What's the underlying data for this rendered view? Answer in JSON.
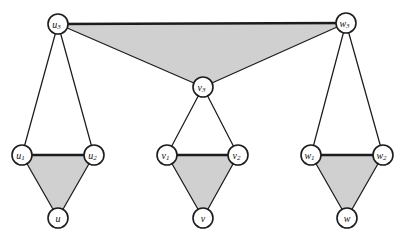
{
  "figure": {
    "background_color": "#ffffff",
    "face_fill_color": "#d0d0d0",
    "edge_color": "#1c1c1c",
    "node_fill_color": "#ffffff",
    "node_stroke_color": "#1c1c1c",
    "node_radius": 10,
    "width": 406,
    "height": 245
  },
  "nodes": [
    {
      "id": "u3",
      "base": "u",
      "sub": "3",
      "x": 58,
      "y": 24,
      "label": "u3"
    },
    {
      "id": "w3",
      "base": "w",
      "sub": "3",
      "x": 346,
      "y": 23,
      "label": "w3"
    },
    {
      "id": "v3",
      "base": "v",
      "sub": "3",
      "x": 203,
      "y": 87,
      "label": "v3"
    },
    {
      "id": "u1",
      "base": "u",
      "sub": "1",
      "x": 22,
      "y": 155,
      "label": "u1"
    },
    {
      "id": "u2",
      "base": "u",
      "sub": "2",
      "x": 94,
      "y": 155,
      "label": "u2"
    },
    {
      "id": "v1",
      "base": "v",
      "sub": "1",
      "x": 167,
      "y": 155,
      "label": "v1"
    },
    {
      "id": "v2",
      "base": "v",
      "sub": "2",
      "x": 238,
      "y": 155,
      "label": "v2"
    },
    {
      "id": "w1",
      "base": "w",
      "sub": "1",
      "x": 311,
      "y": 155,
      "label": "w1"
    },
    {
      "id": "w2",
      "base": "w",
      "sub": "2",
      "x": 383,
      "y": 155,
      "label": "w2"
    },
    {
      "id": "u",
      "base": "u",
      "sub": "",
      "x": 58,
      "y": 218,
      "label": "u"
    },
    {
      "id": "v",
      "base": "v",
      "sub": "",
      "x": 203,
      "y": 218,
      "label": "v"
    },
    {
      "id": "w",
      "base": "w",
      "sub": "",
      "x": 347,
      "y": 218,
      "label": "w"
    }
  ],
  "edges": [
    {
      "id": "e-u3-w3",
      "from": "u3",
      "to": "w3",
      "weight": "thick"
    },
    {
      "id": "e-u3-v3",
      "from": "u3",
      "to": "v3",
      "weight": "thin"
    },
    {
      "id": "e-w3-v3",
      "from": "w3",
      "to": "v3",
      "weight": "thin"
    },
    {
      "id": "e-u3-u1",
      "from": "u3",
      "to": "u1",
      "weight": "thin"
    },
    {
      "id": "e-u3-u2",
      "from": "u3",
      "to": "u2",
      "weight": "thin"
    },
    {
      "id": "e-u1-u2",
      "from": "u1",
      "to": "u2",
      "weight": "thick"
    },
    {
      "id": "e-u1-u",
      "from": "u1",
      "to": "u",
      "weight": "thin"
    },
    {
      "id": "e-u2-u",
      "from": "u2",
      "to": "u",
      "weight": "thin"
    },
    {
      "id": "e-v3-v1",
      "from": "v3",
      "to": "v1",
      "weight": "thin"
    },
    {
      "id": "e-v3-v2",
      "from": "v3",
      "to": "v2",
      "weight": "thin"
    },
    {
      "id": "e-v1-v2",
      "from": "v1",
      "to": "v2",
      "weight": "thick"
    },
    {
      "id": "e-v1-v",
      "from": "v1",
      "to": "v",
      "weight": "thin"
    },
    {
      "id": "e-v2-v",
      "from": "v2",
      "to": "v",
      "weight": "thin"
    },
    {
      "id": "e-w3-w1",
      "from": "w3",
      "to": "w1",
      "weight": "thin"
    },
    {
      "id": "e-w3-w2",
      "from": "w3",
      "to": "w2",
      "weight": "thin"
    },
    {
      "id": "e-w1-w2",
      "from": "w1",
      "to": "w2",
      "weight": "thick"
    },
    {
      "id": "e-w1-w",
      "from": "w1",
      "to": "w",
      "weight": "thin"
    },
    {
      "id": "e-w2-w",
      "from": "w2",
      "to": "w",
      "weight": "thin"
    }
  ],
  "shaded_faces": [
    {
      "id": "face-top",
      "vertices": [
        "u3",
        "w3",
        "v3"
      ]
    },
    {
      "id": "face-u-bot",
      "vertices": [
        "u1",
        "u2",
        "u"
      ]
    },
    {
      "id": "face-v-bot",
      "vertices": [
        "v1",
        "v2",
        "v"
      ]
    },
    {
      "id": "face-w-bot",
      "vertices": [
        "w1",
        "w2",
        "w"
      ]
    }
  ],
  "unshaded_faces": [
    {
      "id": "face-u-top",
      "vertices": [
        "u3",
        "u1",
        "u2"
      ]
    },
    {
      "id": "face-v-top",
      "vertices": [
        "v3",
        "v1",
        "v2"
      ]
    },
    {
      "id": "face-w-top",
      "vertices": [
        "w3",
        "w1",
        "w2"
      ]
    }
  ]
}
